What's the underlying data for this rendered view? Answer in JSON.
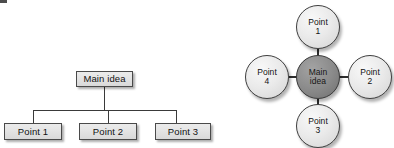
{
  "page": {
    "background_color": "#ffffff",
    "width": 394,
    "height": 148
  },
  "diagrams": [
    {
      "id": "hierarchy-tree",
      "type": "tree",
      "layout": "top-down hierarchy",
      "root": {
        "label": "Main idea"
      },
      "children": [
        {
          "label": "Point 1"
        },
        {
          "label": "Point 2"
        },
        {
          "label": "Point 3"
        }
      ],
      "style": {
        "node_shape": "rectangle",
        "node_fill": "#e4e4e4",
        "node_border": "#4a4a4a",
        "connector_color": "#3a3a3a",
        "shadow": "drop"
      }
    },
    {
      "id": "radial-map",
      "type": "radial",
      "layout": "center with four spokes",
      "center": {
        "label_line1": "Main",
        "label_line2": "idea"
      },
      "spokes": [
        {
          "position": "top",
          "label_line1": "Point",
          "label_line2": "1"
        },
        {
          "position": "right",
          "label_line1": "Point",
          "label_line2": "2"
        },
        {
          "position": "bottom",
          "label_line1": "Point",
          "label_line2": "3"
        },
        {
          "position": "left",
          "label_line1": "Point",
          "label_line2": "4"
        }
      ],
      "style": {
        "node_shape": "circle",
        "center_fill": "#8c8c8c",
        "spoke_fill": "#eaeaea",
        "node_border": "#3f3f3f",
        "connector_color": "#2e2e2e",
        "shadow": "drop"
      }
    }
  ]
}
